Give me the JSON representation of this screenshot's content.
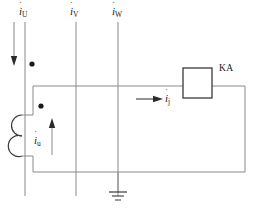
{
  "diagram": {
    "stroke_color": "#6e6e6e",
    "dark_stroke_color": "#3a3a3a",
    "background": "#ffffff"
  },
  "labels": {
    "phase_u": {
      "symbol": "i",
      "subscript": "U",
      "accent": "˙"
    },
    "phase_v": {
      "symbol": "i",
      "subscript": "V",
      "accent": "˙"
    },
    "phase_w": {
      "symbol": "i",
      "subscript": "W",
      "accent": "˙"
    },
    "secondary_current": {
      "symbol": "i",
      "subscript": "u",
      "accent": "˙"
    },
    "relay_current": {
      "symbol": "i",
      "subscript": "j",
      "accent": "˙"
    },
    "relay_device": "KA"
  },
  "components": {
    "relay_box": "KA",
    "ground_symbol": "earth-ground",
    "coil": "current-transformer-secondary-winding",
    "polarity_dots": 2,
    "arrows": [
      "phase-u-down-arrow",
      "secondary-up-arrow",
      "relay-right-arrow"
    ]
  }
}
